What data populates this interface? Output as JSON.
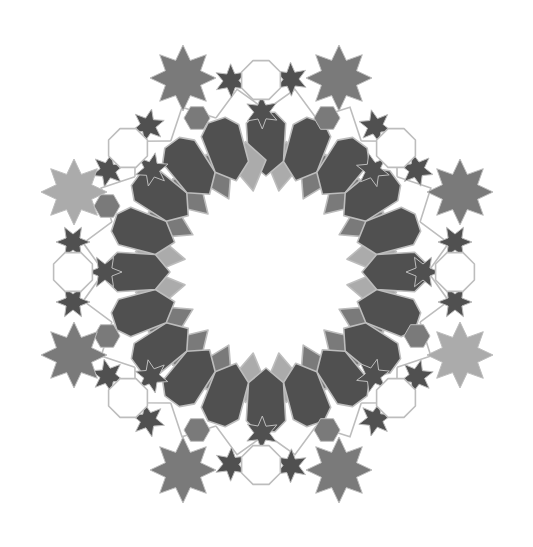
{
  "figure": {
    "title": "",
    "center": [
      266,
      272
    ],
    "background": "#ffffff"
  },
  "colors": {
    "dark": "#505050",
    "medium": "#7a7a7a",
    "light": "#ababab",
    "outline": "#bdbdbd",
    "white": "#ffffff"
  },
  "inner_ring": {
    "count": 20,
    "petal_color": "dark",
    "rhombus_colors": [
      "medium",
      "light"
    ]
  },
  "large_stars": [
    {
      "x": 183,
      "y": 78,
      "color": "medium"
    },
    {
      "x": 339,
      "y": 78,
      "color": "medium"
    },
    {
      "x": 74,
      "y": 192,
      "color": "light"
    },
    {
      "x": 460,
      "y": 192,
      "color": "medium"
    },
    {
      "x": 74,
      "y": 355,
      "color": "medium"
    },
    {
      "x": 460,
      "y": 355,
      "color": "light"
    },
    {
      "x": 183,
      "y": 470,
      "color": "medium"
    },
    {
      "x": 339,
      "y": 470,
      "color": "medium"
    }
  ],
  "octagons": [
    {
      "x": 261,
      "y": 80
    },
    {
      "x": 261,
      "y": 465
    },
    {
      "x": 73,
      "y": 272
    },
    {
      "x": 455,
      "y": 272
    },
    {
      "x": 128,
      "y": 148
    },
    {
      "x": 396,
      "y": 148
    },
    {
      "x": 128,
      "y": 398
    },
    {
      "x": 396,
      "y": 398
    }
  ],
  "hexagons": [
    {
      "x": 197,
      "y": 118
    },
    {
      "x": 327,
      "y": 118
    },
    {
      "x": 107,
      "y": 206
    },
    {
      "x": 107,
      "y": 336
    },
    {
      "x": 417,
      "y": 336
    },
    {
      "x": 197,
      "y": 430
    },
    {
      "x": 327,
      "y": 430
    }
  ]
}
